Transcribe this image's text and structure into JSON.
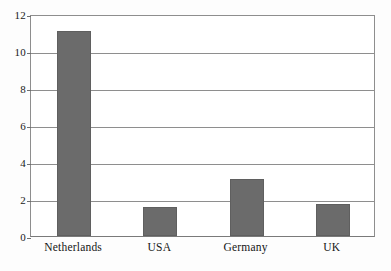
{
  "chart_data": {
    "type": "bar",
    "title": "",
    "xlabel": "",
    "ylabel": "",
    "categories": [
      "Netherlands",
      "USA",
      "Germany",
      "UK"
    ],
    "values": [
      11.1,
      1.55,
      3.1,
      1.75
    ],
    "ylim": [
      0,
      12
    ],
    "yticks": [
      0,
      2,
      4,
      6,
      8,
      10,
      12
    ],
    "ytick_labels": [
      "0",
      "2",
      "4",
      "6",
      "8",
      "10",
      "12"
    ],
    "grid": true,
    "legend": false,
    "legend_position": "none",
    "bar_color": "#6b6b6b",
    "gridline_color": "#8e8e8e",
    "axis_color": "#7a7a7a",
    "background_color": "#ffffff"
  }
}
